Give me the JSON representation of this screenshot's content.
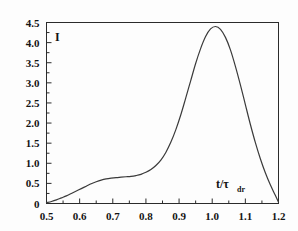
{
  "chart_data": {
    "type": "line",
    "title": "",
    "subtitle": "",
    "xlabel": "t/τ",
    "xlabel_subscript": "dr",
    "ylabel": "I",
    "xlim": [
      0.5,
      1.2
    ],
    "ylim": [
      0.0,
      4.5
    ],
    "grid": false,
    "legend": null,
    "x_ticks": [
      0.5,
      0.6,
      0.7,
      0.8,
      0.9,
      1.0,
      1.1,
      1.2
    ],
    "x_tick_labels": [
      "0.5",
      "0.6",
      "0.7",
      "0.8",
      "0.9",
      "1.0",
      "1.1",
      "1.2"
    ],
    "x_minor_ticks": [
      0.55,
      0.65,
      0.75,
      0.85,
      0.95,
      1.05,
      1.15
    ],
    "y_ticks": [
      0.0,
      0.5,
      1.0,
      1.5,
      2.0,
      2.5,
      3.0,
      3.5,
      4.0,
      4.5
    ],
    "y_tick_labels": [
      "0",
      "0.5",
      "1.0",
      "1.5",
      "2.0",
      "2.5",
      "3.0",
      "3.5",
      "4.0",
      "4.5"
    ],
    "y_minor_ticks": [
      0.25,
      0.75,
      1.25,
      1.75,
      2.25,
      2.75,
      3.25,
      3.75,
      4.25
    ],
    "series": [
      {
        "name": "I",
        "color": "#3a3a3a",
        "x": [
          0.5,
          0.515,
          0.53,
          0.545,
          0.56,
          0.575,
          0.59,
          0.605,
          0.62,
          0.635,
          0.65,
          0.665,
          0.68,
          0.695,
          0.71,
          0.725,
          0.74,
          0.755,
          0.77,
          0.785,
          0.8,
          0.815,
          0.83,
          0.845,
          0.86,
          0.875,
          0.89,
          0.905,
          0.92,
          0.935,
          0.95,
          0.965,
          0.98,
          0.995,
          1.01,
          1.025,
          1.04,
          1.055,
          1.07,
          1.085,
          1.1,
          1.115,
          1.13,
          1.145,
          1.16,
          1.175,
          1.19,
          1.2
        ],
        "y": [
          0.02,
          0.05,
          0.09,
          0.14,
          0.19,
          0.25,
          0.31,
          0.37,
          0.43,
          0.49,
          0.54,
          0.58,
          0.61,
          0.63,
          0.645,
          0.655,
          0.665,
          0.675,
          0.695,
          0.725,
          0.775,
          0.845,
          0.945,
          1.08,
          1.27,
          1.52,
          1.83,
          2.2,
          2.62,
          3.05,
          3.48,
          3.85,
          4.15,
          4.34,
          4.4,
          4.33,
          4.13,
          3.82,
          3.41,
          2.95,
          2.46,
          1.97,
          1.52,
          1.12,
          0.77,
          0.47,
          0.21,
          0.03
        ]
      }
    ],
    "peak": {
      "x": 1.01,
      "y": 4.4
    },
    "shoulder": {
      "x": 0.74,
      "y": 0.665
    }
  },
  "colors": {
    "curve": "#3a3a3a",
    "frame": "#2b2b2b",
    "text": "#141414",
    "background": "#fdfdfd"
  }
}
